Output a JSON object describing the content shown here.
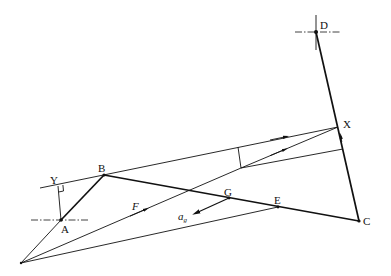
{
  "diagram": {
    "type": "mechanism-velocity-diagram",
    "points": {
      "A": "A",
      "B": "B",
      "C": "C",
      "D": "D",
      "E": "E",
      "G": "G",
      "X": "X",
      "Y": "Y"
    },
    "vectors": {
      "F": "F",
      "ag_main": "a",
      "ag_sub": "g"
    },
    "links": [
      {
        "name": "AB",
        "from": "A",
        "to": "B",
        "style": "thick"
      },
      {
        "name": "BC",
        "from": "B",
        "to": "C",
        "style": "thick"
      },
      {
        "name": "DC",
        "from": "D",
        "to": "C",
        "style": "thick"
      }
    ],
    "fixed_pivots": [
      "A",
      "D"
    ],
    "right_angle_at": "Y"
  }
}
